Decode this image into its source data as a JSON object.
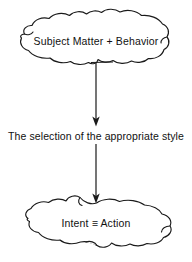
{
  "diagram": {
    "type": "flow-diagram",
    "background_color": "#ffffff",
    "stroke_color": "#1a1a1a",
    "text_color": "#111111",
    "nodes": [
      {
        "id": "subject-matter-behavior",
        "shape": "cloud",
        "label": "Subject Matter  +  Behavior"
      },
      {
        "id": "selection-of-style",
        "shape": "plain-text",
        "label": "The selection of the appropriate style"
      },
      {
        "id": "intent-action",
        "shape": "cloud",
        "label": "Intent ≡ Action"
      }
    ],
    "connectors": [
      {
        "id": "arrow-top",
        "from": "subject-matter-behavior",
        "to": "selection-of-style",
        "style": "solid-arrow",
        "direction": "down"
      },
      {
        "id": "arrow-bottom",
        "from": "selection-of-style",
        "to": "intent-action",
        "style": "solid-arrow",
        "direction": "down"
      }
    ]
  }
}
